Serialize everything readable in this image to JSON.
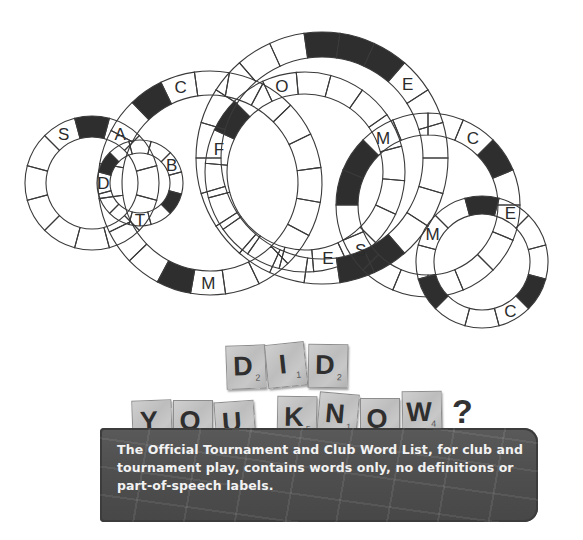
{
  "puzzle": {
    "stroke_color": "#3a3a3a",
    "fill_dark": "#2e2e2e",
    "rings": [
      {
        "id": "ring-1",
        "cx": 92,
        "cy": 183,
        "r_outer": 67,
        "r_inner": 46,
        "segments": 12,
        "start_angle": -15,
        "dark": [
          9
        ],
        "letters": [
          {
            "seg": 10,
            "char": "A"
          },
          {
            "seg": 8,
            "char": "S"
          }
        ]
      },
      {
        "id": "ring-2",
        "cx": 210,
        "cy": 183,
        "r_outer": 112,
        "r_inner": 88,
        "segments": 20,
        "start_angle": -8,
        "dark": [
          13,
          6
        ],
        "letters": [
          {
            "seg": 14,
            "char": "C"
          },
          {
            "seg": 5,
            "char": "M"
          }
        ]
      },
      {
        "id": "ring-3",
        "cx": 140,
        "cy": 183,
        "r_outer": 43,
        "r_inner": 30,
        "segments": 12,
        "start_angle": -15,
        "dark": [
          7,
          1
        ],
        "letters": [
          {
            "seg": 6,
            "char": "D"
          },
          {
            "seg": 11,
            "char": "B"
          },
          {
            "seg": 3,
            "char": "T"
          }
        ]
      },
      {
        "id": "ring-4",
        "cx": 305,
        "cy": 172,
        "r_outer": 100,
        "r_inner": 78,
        "segments": 18,
        "start_angle": 5,
        "dark": [
          10
        ],
        "letters": [
          {
            "seg": 12,
            "char": "O"
          },
          {
            "seg": 9,
            "char": "F"
          },
          {
            "seg": 3,
            "char": "E"
          }
        ]
      },
      {
        "id": "ring-5",
        "cx": 322,
        "cy": 158,
        "r_outer": 126,
        "r_inner": 101,
        "segments": 22,
        "start_angle": 0,
        "dark": [
          16,
          17,
          18,
          3,
          4
        ],
        "letters": [
          {
            "seg": 19,
            "char": "E"
          }
        ]
      },
      {
        "id": "ring-6",
        "cx": 428,
        "cy": 205,
        "r_outer": 92,
        "r_inner": 70,
        "segments": 16,
        "start_angle": 0,
        "dark": [
          9,
          8,
          14
        ],
        "letters": [
          {
            "seg": 10,
            "char": "M"
          },
          {
            "seg": 13,
            "char": "C"
          },
          {
            "seg": 6,
            "char": "S"
          }
        ]
      },
      {
        "id": "ring-7",
        "cx": 482,
        "cy": 262,
        "r_outer": 66,
        "r_inner": 48,
        "segments": 12,
        "start_angle": 15,
        "dark": [
          8,
          4,
          0
        ],
        "letters": [
          {
            "seg": 9,
            "char": "E"
          },
          {
            "seg": 6,
            "char": "M"
          },
          {
            "seg": 1,
            "char": "C"
          }
        ]
      }
    ]
  },
  "heading": {
    "line1": [
      {
        "char": "D",
        "score": "2",
        "x": 226,
        "y": 345,
        "rot": -2
      },
      {
        "char": "I",
        "score": "1",
        "x": 266,
        "y": 343,
        "rot": -6
      },
      {
        "char": "D",
        "score": "2",
        "x": 308,
        "y": 344,
        "rot": 1
      }
    ],
    "line2": [
      {
        "char": "Y",
        "score": "4",
        "x": 132,
        "y": 400,
        "rot": -2
      },
      {
        "char": "O",
        "score": "1",
        "x": 173,
        "y": 400,
        "rot": 0
      },
      {
        "char": "U",
        "score": "1",
        "x": 215,
        "y": 401,
        "rot": -4
      },
      {
        "char": "K",
        "score": "5",
        "x": 277,
        "y": 396,
        "rot": 1
      },
      {
        "char": "N",
        "score": "1",
        "x": 318,
        "y": 393,
        "rot": 5
      },
      {
        "char": "O",
        "score": "1",
        "x": 360,
        "y": 398,
        "rot": 0
      },
      {
        "char": "W",
        "score": "4",
        "x": 402,
        "y": 391,
        "rot": -1
      }
    ],
    "question_mark": "?"
  },
  "fact": {
    "text": "The Official Tournament and Club Word List, for club and tournament play, contains words only, no definitions or part-of-speech labels."
  }
}
